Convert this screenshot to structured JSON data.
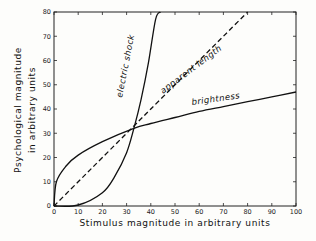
{
  "chart_data": {
    "type": "line",
    "title": "",
    "xlabel": "Stimulus magnitude in arbitrary units",
    "ylabel": "Psychological magnitude in arbitrary units",
    "ylabel_line1": "Psychological magnitude",
    "ylabel_line2": "in arbitrary units",
    "xlim": [
      0,
      100
    ],
    "ylim": [
      0,
      80
    ],
    "x_ticks": [
      0,
      10,
      20,
      30,
      40,
      50,
      60,
      70,
      80,
      90,
      100
    ],
    "y_ticks": [
      0,
      10,
      20,
      30,
      40,
      50,
      60,
      70,
      80
    ],
    "grid": false,
    "legend": "none (curves labeled inline)",
    "series": [
      {
        "name": "electric shock",
        "style": "solid",
        "x": [
          0,
          10,
          20,
          25,
          30,
          33,
          36,
          39,
          42,
          44
        ],
        "y": [
          0,
          0.4,
          5.5,
          12,
          22,
          32,
          44,
          59,
          77,
          80
        ]
      },
      {
        "name": "apparent length",
        "style": "dashed",
        "x": [
          0,
          10,
          20,
          33,
          40,
          50,
          60,
          70,
          80
        ],
        "y": [
          0,
          10,
          20,
          33,
          40,
          50,
          60,
          70,
          80
        ]
      },
      {
        "name": "brightness",
        "style": "solid",
        "x": [
          0,
          1,
          5,
          10,
          20,
          33,
          40,
          50,
          60,
          70,
          80,
          90,
          100
        ],
        "y": [
          0,
          10,
          16.5,
          21,
          26.5,
          32,
          34,
          36.5,
          39,
          41,
          43,
          45,
          47
        ]
      }
    ]
  },
  "labels": {
    "electric_shock": "electric shock",
    "apparent_length": "apparent length",
    "brightness": "brightness"
  }
}
